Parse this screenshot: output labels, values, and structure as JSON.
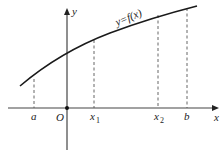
{
  "diagram": {
    "type": "function-graph",
    "curve_label": "y=f(x)",
    "axes": {
      "x_label": "x",
      "y_label": "y",
      "origin_label": "O"
    },
    "x_markers": [
      {
        "label": "a",
        "sub": ""
      },
      {
        "label": "x",
        "sub": "1"
      },
      {
        "label": "x",
        "sub": "2"
      },
      {
        "label": "b",
        "sub": ""
      }
    ],
    "colors": {
      "curve": "#1a1a1a",
      "axis": "#333333",
      "dashed": "#555555"
    }
  }
}
